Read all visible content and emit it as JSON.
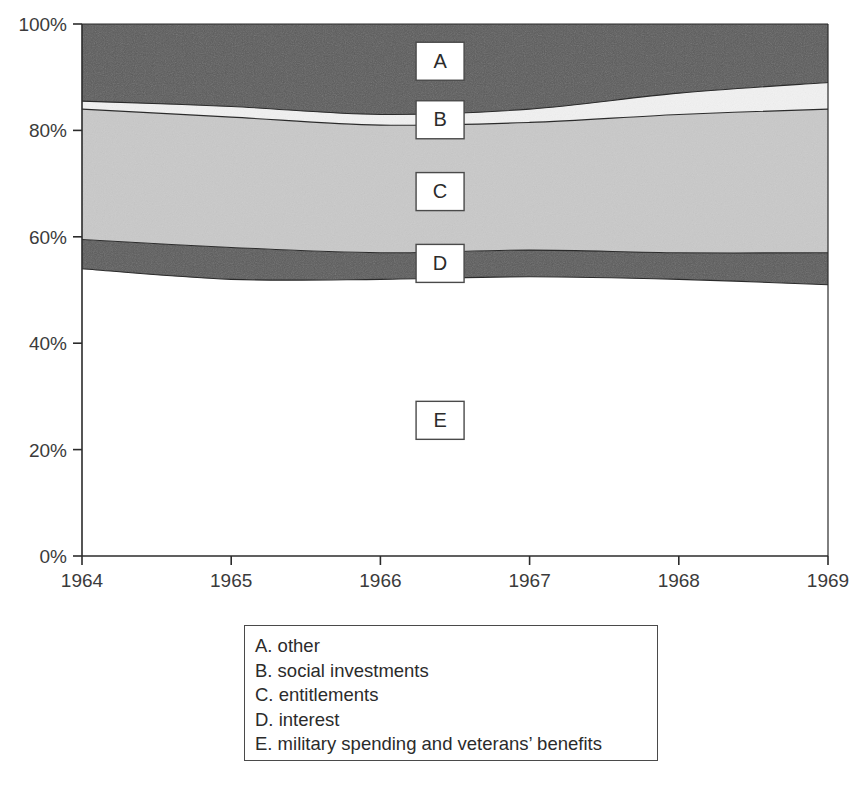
{
  "chart_data": {
    "type": "area",
    "title": "",
    "xlabel": "",
    "ylabel": "",
    "stacked": true,
    "normalized": true,
    "grid": false,
    "legend_position": "below-plot",
    "x": [
      1964,
      1965,
      1966,
      1967,
      1968,
      1969
    ],
    "xtick_labels": [
      "1964",
      "1965",
      "1966",
      "1967",
      "1968",
      "1969"
    ],
    "xlim": [
      1964,
      1969
    ],
    "ylim": [
      0,
      100
    ],
    "ytick_labels": [
      "0%",
      "20%",
      "40%",
      "60%",
      "80%",
      "100%"
    ],
    "ytick_values": [
      0,
      20,
      40,
      60,
      80,
      100
    ],
    "series": [
      {
        "key": "E",
        "name": "military spending and veterans' benefits",
        "color": "#ffffff",
        "values": [
          54.0,
          52.0,
          52.0,
          52.5,
          52.0,
          51.0
        ]
      },
      {
        "key": "D",
        "name": "interest",
        "color": "#5b5b5b",
        "values": [
          5.5,
          6.0,
          5.0,
          5.0,
          5.0,
          6.0
        ]
      },
      {
        "key": "C",
        "name": "entitlements",
        "color": "#c9c9c9",
        "values": [
          24.5,
          24.5,
          24.0,
          24.0,
          26.0,
          27.0
        ]
      },
      {
        "key": "B",
        "name": "social investments",
        "color": "#f2f2f2",
        "values": [
          1.5,
          2.0,
          2.0,
          2.5,
          4.0,
          5.0
        ]
      },
      {
        "key": "A",
        "name": "other",
        "color": "#5b5b5b",
        "values": [
          14.5,
          15.5,
          17.0,
          16.0,
          13.0,
          11.0
        ]
      }
    ],
    "cumulative_boundaries": {
      "top_of_E": [
        54.0,
        52.0,
        52.0,
        52.5,
        52.0,
        51.0
      ],
      "top_of_D": [
        59.5,
        58.0,
        57.0,
        57.5,
        57.0,
        57.0
      ],
      "top_of_C": [
        84.0,
        82.5,
        81.0,
        81.5,
        83.0,
        84.0
      ],
      "top_of_B": [
        85.5,
        84.5,
        83.0,
        84.0,
        87.0,
        89.0
      ],
      "top_of_A": [
        100,
        100,
        100,
        100,
        100,
        100
      ]
    },
    "plot_markers": [
      {
        "key": "A",
        "label": "A",
        "x_year": 1966.4,
        "y_percent": 93.0
      },
      {
        "key": "B",
        "label": "B",
        "x_year": 1966.4,
        "y_percent": 82.0
      },
      {
        "key": "C",
        "label": "C",
        "x_year": 1966.4,
        "y_percent": 68.5
      },
      {
        "key": "D",
        "label": "D",
        "x_year": 1966.4,
        "y_percent": 55.0
      },
      {
        "key": "E",
        "label": "E",
        "x_year": 1966.4,
        "y_percent": 25.5
      }
    ]
  },
  "legend": {
    "items": [
      {
        "label": "A. other"
      },
      {
        "label": "B. social investments"
      },
      {
        "label": "C. entitlements"
      },
      {
        "label": "D. interest"
      },
      {
        "label": "E. military spending and veterans’ benefits"
      }
    ]
  },
  "colors": {
    "dark_gray": "#5b5b5b",
    "light_gray": "#c9c9c9",
    "near_white": "#f2f2f2",
    "white": "#ffffff",
    "axis": "#2b2b2b",
    "text": "#2b2b2b"
  }
}
